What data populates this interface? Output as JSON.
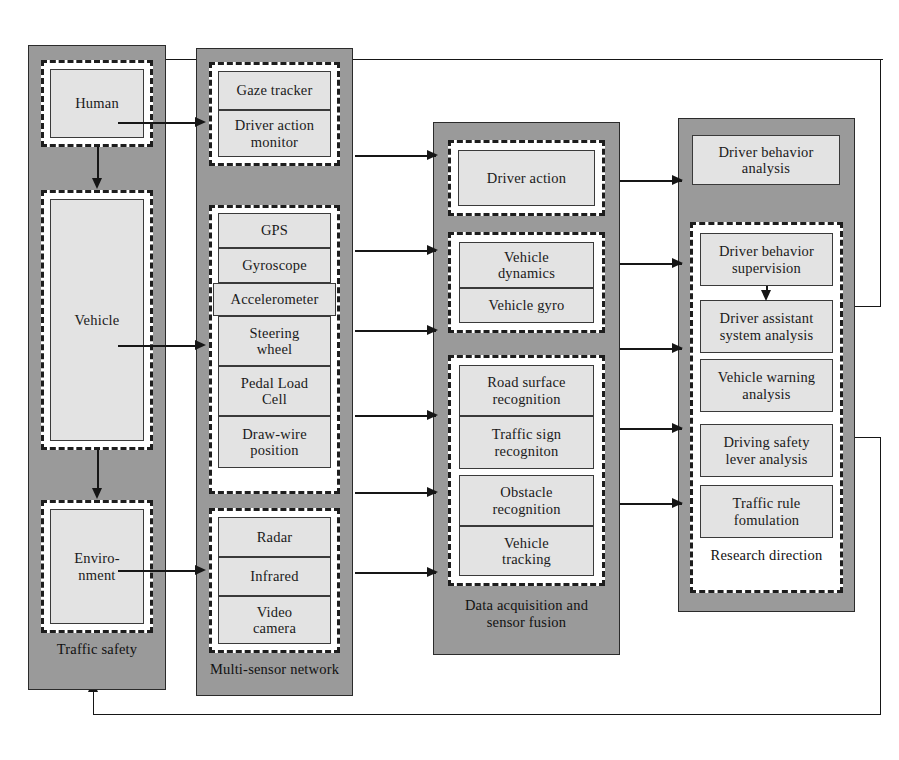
{
  "diagram": {
    "colors": {
      "panel_fill": "#9a9a9a",
      "node_fill": "#e3e3e3",
      "group_fill": "#ffffff",
      "line": "#161616",
      "border": "#2b2b2b"
    }
  },
  "columns": [
    {
      "id": "traffic-safety",
      "caption": "Traffic safety",
      "groups": [
        {
          "id": "human-group",
          "nodes": [
            {
              "label": "Human"
            }
          ]
        },
        {
          "id": "vehicle-group",
          "nodes": [
            {
              "label": "Vehicle"
            }
          ]
        },
        {
          "id": "environment-group",
          "nodes": [
            {
              "label": "Enviro-\nnment"
            }
          ]
        }
      ]
    },
    {
      "id": "multi-sensor-network",
      "caption": "Multi-sensor network",
      "groups": [
        {
          "id": "driver-sensors",
          "nodes": [
            {
              "label": "Gaze tracker"
            },
            {
              "label": "Driver action\nmonitor"
            }
          ]
        },
        {
          "id": "vehicle-sensors",
          "nodes": [
            {
              "label": "GPS"
            },
            {
              "label": "Gyroscope"
            },
            {
              "label": "Accelerometer"
            },
            {
              "label": "Steering\nwheel"
            },
            {
              "label": "Pedal Load\nCell"
            },
            {
              "label": "Draw-wire\nposition"
            }
          ]
        },
        {
          "id": "environment-sensors",
          "nodes": [
            {
              "label": "Radar"
            },
            {
              "label": "Infrared"
            },
            {
              "label": "Video\ncamera"
            }
          ]
        }
      ]
    },
    {
      "id": "data-acquisition",
      "caption": "Data acquisition and\nsensor fusion",
      "groups": [
        {
          "id": "driver-action-group",
          "nodes": [
            {
              "label": "Driver action"
            }
          ]
        },
        {
          "id": "vehicle-state-group",
          "nodes": [
            {
              "label": "Vehicle\ndynamics"
            },
            {
              "label": "Vehicle gyro"
            }
          ]
        },
        {
          "id": "environment-perception-group",
          "nodes": [
            {
              "label": "Road surface\nrecognition"
            },
            {
              "label": "Traffic sign\nrecogniton"
            },
            {
              "label": "Obstacle\nrecognition"
            },
            {
              "label": "Vehicle\ntracking"
            }
          ]
        }
      ]
    },
    {
      "id": "research",
      "caption": "",
      "top_node": {
        "label": "Driver behavior\nanalysis"
      },
      "groups": [
        {
          "id": "research-direction-group",
          "caption": "Research direction",
          "nodes": [
            {
              "label": "Driver behavior\nsupervision"
            },
            {
              "label": "Driver assistant\nsystem analysis"
            },
            {
              "label": "Vehicle warning\nanalysis"
            },
            {
              "label": "Driving safety\nlever analysis"
            },
            {
              "label": "Traffic rule\nfomulation"
            }
          ]
        }
      ]
    }
  ],
  "connections": {
    "internal_vertical": [
      {
        "from": "Human",
        "to": "Vehicle"
      },
      {
        "from": "Vehicle",
        "to": "Enviro-nment"
      },
      {
        "from": "Driver behavior supervision",
        "to": "Driver assistant system analysis"
      }
    ],
    "col1_to_col2": [
      {
        "from": "Human",
        "to": "Gaze tracker / Driver action monitor"
      },
      {
        "from": "Vehicle",
        "to": "Vehicle sensors"
      },
      {
        "from": "Enviro-nment",
        "to": "Radar / Infrared / Video camera"
      }
    ],
    "col2_to_col3": 5,
    "col3_to_col4": 5,
    "feedback": [
      {
        "id": "top-feedback",
        "from": "Research direction (Driver behavior supervision level)",
        "to": "Traffic safety (top)"
      },
      {
        "id": "bottom-feedback",
        "from": "Research direction (Vehicle warning analysis level)",
        "to": "Traffic safety (bottom)"
      }
    ]
  }
}
